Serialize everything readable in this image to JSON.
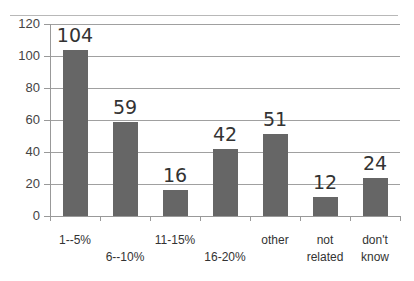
{
  "chart_data": {
    "type": "bar",
    "title": "",
    "xlabel": "",
    "ylabel": "",
    "categories": [
      "1--5%",
      "6--10%",
      "11-15%",
      "16-20%",
      "other",
      "not related",
      "don't know"
    ],
    "values": [
      104,
      59,
      16,
      42,
      51,
      12,
      24
    ],
    "ylim": [
      0,
      120
    ],
    "yticks": [
      0,
      20,
      40,
      60,
      80,
      100,
      120
    ],
    "grid": true,
    "legend": "none",
    "data_labels": true,
    "bar_color": "#666666"
  },
  "yaxis": {
    "ticks": [
      "0",
      "20",
      "40",
      "60",
      "80",
      "100",
      "120"
    ]
  },
  "bars": [
    {
      "label_line1": "1--5%",
      "label_line2": "",
      "value": "104"
    },
    {
      "label_line1": "",
      "label_line2": "6--10%",
      "value": "59"
    },
    {
      "label_line1": "11-15%",
      "label_line2": "",
      "value": "16"
    },
    {
      "label_line1": "",
      "label_line2": "16-20%",
      "value": "42"
    },
    {
      "label_line1": "other",
      "label_line2": "",
      "value": "51"
    },
    {
      "label_line1": "not",
      "label_line2": "related",
      "value": "12"
    },
    {
      "label_line1": "don't",
      "label_line2": "know",
      "value": "24"
    }
  ]
}
